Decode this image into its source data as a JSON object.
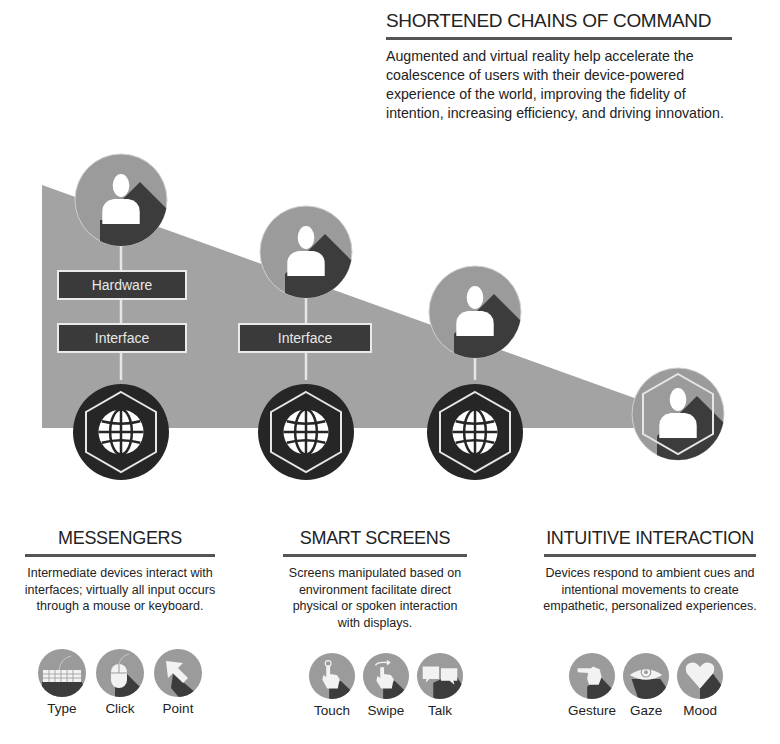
{
  "intro": {
    "title": "SHORTENED CHAINS OF COMMAND",
    "text": "Augmented and virtual reality help accelerate the coalescence of users with their device-powered experience of the world, improving the fidelity of intention, increasing efficiency, and driving innovation."
  },
  "diagram": {
    "columns": [
      {
        "user_icon": "user-icon",
        "boxes": [
          "Hardware",
          "Interface"
        ],
        "device_icon": "globe-icon"
      },
      {
        "user_icon": "user-icon",
        "boxes": [
          "Interface"
        ],
        "device_icon": "globe-icon"
      },
      {
        "user_icon": "user-icon",
        "boxes": [],
        "device_icon": "globe-icon"
      },
      {
        "user_icon": "user-hexagon-icon",
        "boxes": [],
        "device_icon": null
      }
    ],
    "colors": {
      "background_wedge": "#a3a3a3",
      "user_circle": "#9b9b9b",
      "user_shadow": "#3c3c3c",
      "label_box": "#3a3a3a",
      "device_circle": "#262626"
    }
  },
  "sections": [
    {
      "title": "MESSENGERS",
      "text": "Intermediate devices interact with interfaces; virtually all input occurs through a mouse or keyboard.",
      "icons": [
        {
          "name": "keyboard-icon",
          "label": "Type"
        },
        {
          "name": "mouse-icon",
          "label": "Click"
        },
        {
          "name": "cursor-arrow-icon",
          "label": "Point"
        }
      ]
    },
    {
      "title": "SMART SCREENS",
      "text": "Screens manipulated based on environment facilitate direct physical or spoken interaction with displays.",
      "icons": [
        {
          "name": "touch-hand-icon",
          "label": "Touch"
        },
        {
          "name": "swipe-hand-icon",
          "label": "Swipe"
        },
        {
          "name": "speech-bubbles-icon",
          "label": "Talk"
        }
      ]
    },
    {
      "title": "INTUITIVE INTERACTION",
      "text": "Devices respond to ambient cues and intentional movements to create empathetic, personalized experiences.",
      "icons": [
        {
          "name": "pointing-hand-icon",
          "label": "Gesture"
        },
        {
          "name": "eye-icon",
          "label": "Gaze"
        },
        {
          "name": "heart-icon",
          "label": "Mood"
        }
      ]
    }
  ]
}
